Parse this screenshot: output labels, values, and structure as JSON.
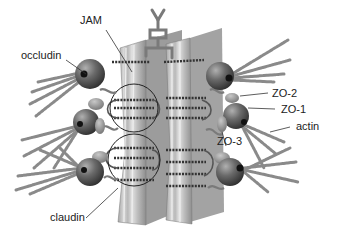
{
  "diagram": {
    "type": "biological-schematic",
    "labels": {
      "jam": "JAM",
      "occludin": "occludin",
      "zo2": "ZO-2",
      "zo1": "ZO-1",
      "actin": "actin",
      "zo3": "ZO-3",
      "claudin": "claudin"
    },
    "colors": {
      "background": "#ffffff",
      "membrane_face": "#b9b9b9",
      "membrane_stripe_light": "#dcdcdc",
      "membrane_side": "#9a9a9a",
      "protein_sphere": "#5a5a5a",
      "protein_highlight": "#a8a8a8",
      "actin_filament": "#8a8a8a",
      "strand": "#3a3a3a",
      "leader_line": "#333333",
      "text": "#222222"
    }
  }
}
